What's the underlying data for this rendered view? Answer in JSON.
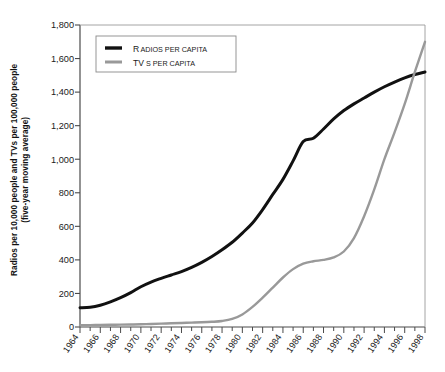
{
  "chart_data": {
    "type": "line",
    "title": "",
    "xlabel": "",
    "ylabel": "Radios per 10,000 people and TVs per 100,000 people (five-year moving average)",
    "ylabel_line1": "Radios per 10,000 people and TVs per 100,000 people",
    "ylabel_line2": "(five-year moving average)",
    "xlim": [
      1964,
      1998
    ],
    "ylim": [
      0,
      1800
    ],
    "yticks": [
      0,
      200,
      400,
      600,
      800,
      1000,
      1200,
      1400,
      1600,
      1800
    ],
    "ytick_labels": [
      "0",
      "200",
      "400",
      "600",
      "800",
      "1,000",
      "1,200",
      "1,400",
      "1,600",
      "1,800"
    ],
    "xticks_labeled": [
      1964,
      1966,
      1968,
      1970,
      1972,
      1974,
      1976,
      1978,
      1980,
      1982,
      1984,
      1986,
      1988,
      1990,
      1992,
      1994,
      1996,
      1998
    ],
    "xtick_labels": [
      "1964",
      "1966",
      "1968",
      "1970",
      "1972",
      "1974",
      "1976",
      "1978",
      "1980",
      "1982",
      "1984",
      "1986",
      "1988",
      "1990",
      "1992",
      "1994",
      "1996",
      "1998"
    ],
    "xtick_minor_step": 1,
    "grid": false,
    "legend_position": "top-left",
    "x": [
      1964,
      1965,
      1966,
      1967,
      1968,
      1969,
      1970,
      1971,
      1972,
      1973,
      1974,
      1975,
      1976,
      1977,
      1978,
      1979,
      1980,
      1981,
      1982,
      1983,
      1984,
      1985,
      1986,
      1987,
      1988,
      1989,
      1990,
      1991,
      1992,
      1993,
      1994,
      1995,
      1996,
      1997,
      1998
    ],
    "series": [
      {
        "name": "Radios per capita",
        "color": "#111111",
        "values": [
          115,
          118,
          130,
          150,
          175,
          205,
          240,
          268,
          290,
          310,
          330,
          355,
          385,
          420,
          460,
          505,
          560,
          620,
          700,
          790,
          880,
          990,
          1105,
          1125,
          1180,
          1240,
          1290,
          1330,
          1365,
          1400,
          1432,
          1460,
          1485,
          1505,
          1520
        ]
      },
      {
        "name": "TVs per capita",
        "color": "#999999",
        "values": [
          10,
          11,
          12,
          13,
          14,
          15,
          16,
          18,
          20,
          22,
          24,
          26,
          28,
          31,
          36,
          48,
          75,
          120,
          175,
          235,
          295,
          345,
          378,
          392,
          400,
          415,
          450,
          530,
          660,
          820,
          1000,
          1160,
          1330,
          1520,
          1700
        ]
      }
    ]
  },
  "legend": {
    "items": [
      {
        "label_first": "R",
        "label_rest": "ADIOS PER CAPITA",
        "swatch": "#111111"
      },
      {
        "label_first": "TV",
        "label_rest": "S PER CAPITA",
        "swatch": "#999999"
      }
    ]
  }
}
